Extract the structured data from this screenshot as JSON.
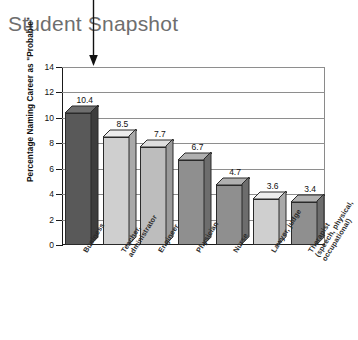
{
  "title": "Student Snapshot",
  "pointer": {
    "icon": "down-arrow-icon"
  },
  "chart_data": {
    "type": "bar",
    "title": "Student Snapshot",
    "xlabel": "",
    "ylabel": "Percentage Naming Career as \"Probable\"",
    "ylim": [
      0,
      14
    ],
    "ytick_step": 2,
    "yticks": [
      "0",
      "2",
      "4",
      "6",
      "8",
      "10",
      "12",
      "14"
    ],
    "grid": true,
    "legend": "none",
    "style": "3d-column",
    "categories": [
      "Business",
      "Teacher, administrator",
      "Engineer",
      "Physician",
      "Nurse",
      "Lawyer, judge",
      "Therapist (speech, physical, occupational)"
    ],
    "category_lines": [
      [
        "Business"
      ],
      [
        "Teacher,",
        "administrator"
      ],
      [
        "Engineer"
      ],
      [
        "Physician"
      ],
      [
        "Nurse"
      ],
      [
        "Lawyer, judge"
      ],
      [
        "Therapist",
        "(speech, physical,",
        "occupational)"
      ]
    ],
    "values": [
      10.4,
      8.5,
      7.7,
      6.7,
      4.7,
      3.6,
      3.4
    ],
    "value_labels": [
      "10.4",
      "8.5",
      "7.7",
      "6.7",
      "4.7",
      "3.6",
      "3.4"
    ],
    "bar_colors": [
      "#595959",
      "#cfcfcf",
      "#bdbdbd",
      "#8f8f8f",
      "#8f8f8f",
      "#cfcfcf",
      "#8f8f8f"
    ],
    "bar_top_colors": [
      "#6e6e6e",
      "#ededed",
      "#dedede",
      "#b0b0b0",
      "#b0b0b0",
      "#ededed",
      "#b0b0b0"
    ],
    "bar_side_colors": [
      "#3d3d3d",
      "#a9a9a9",
      "#9a9a9a",
      "#6d6d6d",
      "#6d6d6d",
      "#a9a9a9",
      "#6d6d6d"
    ]
  },
  "colors": {
    "title_text": "#6e6e6e",
    "axis": "#1a1a1a",
    "gridline": "#8e8e8e",
    "background": "#ffffff"
  }
}
